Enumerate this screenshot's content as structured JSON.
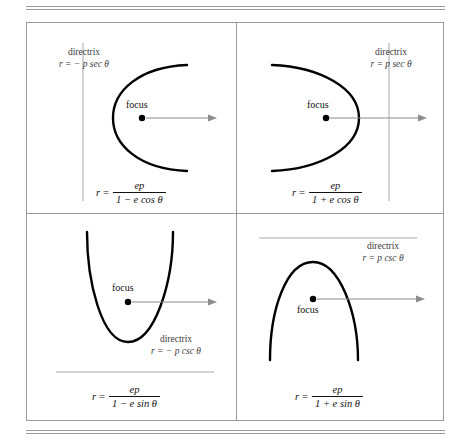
{
  "figure": {
    "type": "conic-sections-polar-reference",
    "rules": {
      "top": "double-rule",
      "bottom": "double-rule"
    },
    "colors": {
      "curve": "#000000",
      "axis": "#8c8c8c",
      "directrix_line": "#a8a8a8",
      "grid": "#9a9a9a",
      "text": "#3c3c3c"
    },
    "panels": [
      {
        "id": "top-left",
        "opens": "right",
        "focus_label": "focus",
        "focus_label_position": "above",
        "directrix": {
          "title": "directrix",
          "equation": "r = − p sec θ",
          "orientation": "vertical",
          "side": "left"
        },
        "equation": {
          "lhs": "r",
          "eq": "=",
          "numerator": "ep",
          "denominator": "1 − e cos θ"
        }
      },
      {
        "id": "top-right",
        "opens": "left",
        "focus_label": "focus",
        "focus_label_position": "above",
        "directrix": {
          "title": "directrix",
          "equation": "r = p sec θ",
          "orientation": "vertical",
          "side": "right"
        },
        "equation": {
          "lhs": "r",
          "eq": "=",
          "numerator": "ep",
          "denominator": "1 + e cos θ"
        }
      },
      {
        "id": "bottom-left",
        "opens": "up",
        "focus_label": "focus",
        "focus_label_position": "above",
        "directrix": {
          "title": "directrix",
          "equation": "r = − p csc θ",
          "orientation": "horizontal",
          "side": "bottom"
        },
        "equation": {
          "lhs": "r",
          "eq": "=",
          "numerator": "ep",
          "denominator": "1 − e sin θ"
        }
      },
      {
        "id": "bottom-right",
        "opens": "down",
        "focus_label": "focus",
        "focus_label_position": "below",
        "directrix": {
          "title": "directrix",
          "equation": "r = p csc θ",
          "orientation": "horizontal",
          "side": "top"
        },
        "equation": {
          "lhs": "r",
          "eq": "=",
          "numerator": "ep",
          "denominator": "1 + e sin θ"
        }
      }
    ]
  }
}
